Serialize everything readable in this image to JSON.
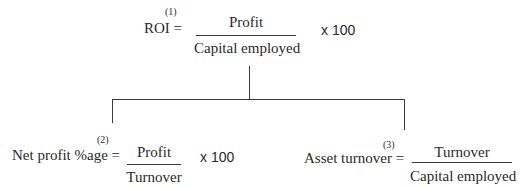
{
  "diagram": {
    "root": {
      "index": "(1)",
      "label": "ROI =",
      "numerator": "Profit",
      "denominator": "Capital employed",
      "multiplier": "x 100"
    },
    "children": [
      {
        "index": "(2)",
        "label": "Net profit %age =",
        "numerator": "Profit",
        "denominator": "Turnover",
        "multiplier": "x 100"
      },
      {
        "index": "(3)",
        "label": "Asset turnover =",
        "numerator": "Turnover",
        "denominator": "Capital employed",
        "multiplier": ""
      }
    ],
    "line_color": "#3a3a3a",
    "text_color": "#2a2a2a"
  }
}
